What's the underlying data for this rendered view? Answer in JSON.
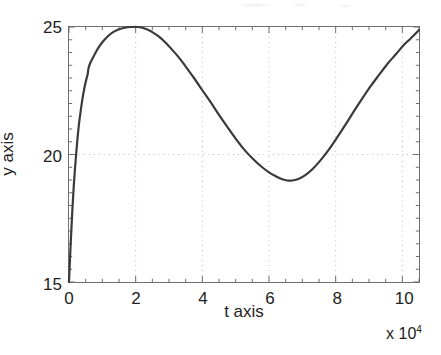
{
  "figure": {
    "background_color": "#ffffff",
    "axis_color": "#6e6e73",
    "line_color": "#3a3a3a",
    "grid_color": "#b9b9bd"
  },
  "labels": {
    "ylabel": "y axis",
    "xlabel": "t axis",
    "exponent_prefix": "x 10",
    "exponent_power": "4"
  },
  "chart_data": {
    "type": "line",
    "title": "",
    "subtitle": "",
    "xlabel": "t axis",
    "ylabel": "y axis",
    "x_scale_factor": "x 10^4",
    "xlim": [
      0,
      10.5
    ],
    "ylim": [
      15,
      25
    ],
    "xticks": [
      0,
      2,
      4,
      6,
      8,
      10
    ],
    "xtick_labels": [
      "0",
      "2",
      "4",
      "6",
      "8",
      "10"
    ],
    "yticks": [
      15,
      20,
      25
    ],
    "ytick_labels": [
      "15",
      "20",
      "25"
    ],
    "grid": true,
    "grid_style": "dotted",
    "legend": null,
    "legend_position": "none",
    "annotations": [],
    "series": [
      {
        "name": "y(t)",
        "color": "#3a3a3a",
        "line_width": 2.2,
        "x": [
          0.0,
          0.03,
          0.06,
          0.1,
          0.14,
          0.18,
          0.22,
          0.26,
          0.3,
          0.34,
          0.4,
          0.46,
          0.52,
          0.56,
          0.58,
          0.6,
          0.64,
          0.7,
          0.78,
          0.88,
          1.0,
          1.15,
          1.3,
          1.45,
          1.6,
          1.75,
          1.9,
          2.05,
          2.2,
          2.35,
          2.5,
          2.7,
          2.9,
          3.1,
          3.3,
          3.5,
          3.75,
          4.0,
          4.25,
          4.5,
          4.75,
          5.0,
          5.25,
          5.5,
          5.75,
          6.0,
          6.2,
          6.4,
          6.55,
          6.7,
          6.9,
          7.1,
          7.3,
          7.55,
          7.8,
          8.05,
          8.3,
          8.55,
          8.8,
          9.05,
          9.3,
          9.55,
          9.8,
          10.05,
          10.25,
          10.5
        ],
        "y": [
          15.0,
          15.9,
          16.75,
          17.8,
          18.7,
          19.45,
          20.1,
          20.7,
          21.2,
          21.6,
          22.15,
          22.6,
          22.95,
          23.15,
          23.35,
          23.45,
          23.6,
          23.75,
          23.95,
          24.18,
          24.4,
          24.62,
          24.78,
          24.88,
          24.95,
          24.99,
          25.0,
          25.0,
          24.97,
          24.9,
          24.8,
          24.62,
          24.38,
          24.1,
          23.8,
          23.45,
          23.0,
          22.52,
          22.05,
          21.55,
          21.08,
          20.62,
          20.2,
          19.85,
          19.55,
          19.3,
          19.15,
          19.03,
          18.98,
          18.98,
          19.05,
          19.2,
          19.42,
          19.78,
          20.2,
          20.68,
          21.18,
          21.7,
          22.2,
          22.68,
          23.12,
          23.55,
          23.92,
          24.3,
          24.55,
          24.88
        ]
      }
    ],
    "features": {
      "start_point": {
        "x": 0,
        "y": 15
      },
      "kink_point": {
        "x": 0.58,
        "y": 23.4
      },
      "peak": {
        "x": 2.1,
        "y": 25.0
      },
      "trough": {
        "x": 6.55,
        "y": 18.98
      },
      "end_point": {
        "x": 10.5,
        "y": 24.88
      }
    }
  }
}
